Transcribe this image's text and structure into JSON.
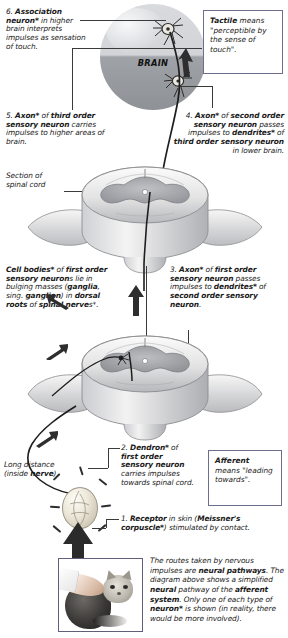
{
  "figure": {
    "brain_label": "BRAIN",
    "section_label_line1": "Section of",
    "section_label_line2": "spinal cord",
    "long_distance_line1": "Long distance",
    "long_distance_line2": "(inside nerve)"
  },
  "steps": {
    "step6": "6. Association neuron* in higher brain interprets impulses as sensation of touch.",
    "step5": "5. Axon* of third order sensory neuron carries impulses to higher areas of brain.",
    "step4": "4. Axon* of second order sensory neuron passes impulses to dendrites* of third order sensory neuron in lower brain.",
    "cellbodies": "Cell bodies* of first order sensory neurons lie in bulging masses (ganglia, sing. ganglion) in dorsal roots of spinal nerves*.",
    "step3": "3. Axon* of first order sensory neuron passes impulses to dendrites* of second order sensory neuron.",
    "step2": "2. Dendron* of first order sensory neuron carries impulses towards spinal cord.",
    "step1": "1. Receptor in skin (Meissner's corpuscle*) stimulated by contact."
  },
  "definitions": {
    "tactile": {
      "term": "Tactile",
      "text": "means \"perceptible by the sense of touch\"."
    },
    "afferent": {
      "term": "Afferent",
      "text": "means \"leading towards\"."
    }
  },
  "caption": "The routes taken by nervous impulses are neural pathways. The diagram above shows a simplified neural pathway of the afferent system. Only one of each type of neuron* is shown (in reality, there would be more involved).",
  "colors": {
    "box_border": "#6d6d8d",
    "text": "#1a1a1a",
    "grey_text": "#4a4a4a",
    "brain_upper": "#d8dadd",
    "brain_lower": "#92959a",
    "cord_grey_matter": "#a9aaae",
    "arrow": "#2e2e2e"
  }
}
